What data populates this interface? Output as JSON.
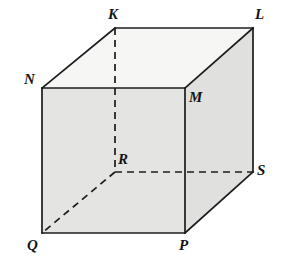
{
  "figure": {
    "name": "cube-diagram",
    "type": "geometric-solid",
    "solid": "cube",
    "canvas": {
      "width": 281,
      "height": 269
    },
    "colors": {
      "background": "#ffffff",
      "edge_stroke": "#1c1c1c",
      "hidden_edge_stroke": "#1c1c1c",
      "top_face_fill": "#f6f6f4",
      "front_face_fill": "#e4e4e2",
      "right_face_fill": "#e0e0de",
      "label_color": "#141414"
    },
    "stroke_widths": {
      "visible_edge": 1.7,
      "hidden_edge": 1.7
    },
    "dash_pattern": "7 5"
  },
  "vertices": [
    {
      "id": "K",
      "label": "K",
      "x": 115,
      "y": 28,
      "hidden": false,
      "label_x": 108,
      "label_y": 7
    },
    {
      "id": "L",
      "label": "L",
      "x": 253,
      "y": 28,
      "hidden": false,
      "label_x": 255,
      "label_y": 7
    },
    {
      "id": "N",
      "label": "N",
      "x": 42,
      "y": 88,
      "hidden": false,
      "label_x": 24,
      "label_y": 72
    },
    {
      "id": "M",
      "label": "M",
      "x": 185,
      "y": 88,
      "hidden": false,
      "label_x": 189,
      "label_y": 90
    },
    {
      "id": "R",
      "label": "R",
      "x": 115,
      "y": 172,
      "hidden": true,
      "label_x": 118,
      "label_y": 152
    },
    {
      "id": "S",
      "label": "S",
      "x": 253,
      "y": 172,
      "hidden": false,
      "label_x": 257,
      "label_y": 163
    },
    {
      "id": "Q",
      "label": "Q",
      "x": 42,
      "y": 233,
      "hidden": false,
      "label_x": 27,
      "label_y": 238
    },
    {
      "id": "P",
      "label": "P",
      "x": 185,
      "y": 233,
      "hidden": false,
      "label_x": 179,
      "label_y": 238
    }
  ],
  "faces": [
    {
      "id": "top",
      "name": "face-K-L-M-N",
      "points": "115,28 253,28 185,88 42,88",
      "fill_key": "top_face_fill"
    },
    {
      "id": "front",
      "name": "face-N-M-P-Q",
      "points": "42,88 185,88 185,233 42,233",
      "fill_key": "front_face_fill"
    },
    {
      "id": "right",
      "name": "face-M-L-S-P",
      "points": "185,88 253,28 253,172 185,233",
      "fill_key": "right_face_fill"
    }
  ],
  "visible_edges": [
    {
      "id": "KL",
      "name": "edge-K-L",
      "from": "K",
      "to": "L",
      "x1": 115,
      "y1": 28,
      "x2": 253,
      "y2": 28
    },
    {
      "id": "KN",
      "name": "edge-K-N",
      "from": "K",
      "to": "N",
      "x1": 115,
      "y1": 28,
      "x2": 42,
      "y2": 88
    },
    {
      "id": "LM",
      "name": "edge-L-M",
      "from": "L",
      "to": "M",
      "x1": 253,
      "y1": 28,
      "x2": 185,
      "y2": 88
    },
    {
      "id": "LS",
      "name": "edge-L-S",
      "from": "L",
      "to": "S",
      "x1": 253,
      "y1": 28,
      "x2": 253,
      "y2": 172
    },
    {
      "id": "NM",
      "name": "edge-N-M",
      "from": "N",
      "to": "M",
      "x1": 42,
      "y1": 88,
      "x2": 185,
      "y2": 88
    },
    {
      "id": "NQ",
      "name": "edge-N-Q",
      "from": "N",
      "to": "Q",
      "x1": 42,
      "y1": 88,
      "x2": 42,
      "y2": 233
    },
    {
      "id": "MP",
      "name": "edge-M-P",
      "from": "M",
      "to": "P",
      "x1": 185,
      "y1": 88,
      "x2": 185,
      "y2": 233
    },
    {
      "id": "QP",
      "name": "edge-Q-P",
      "from": "Q",
      "to": "P",
      "x1": 42,
      "y1": 233,
      "x2": 185,
      "y2": 233
    },
    {
      "id": "PS",
      "name": "edge-P-S",
      "from": "P",
      "to": "S",
      "x1": 185,
      "y1": 233,
      "x2": 253,
      "y2": 172
    }
  ],
  "hidden_edges": [
    {
      "id": "KR",
      "name": "hidden-edge-K-R",
      "from": "K",
      "to": "R",
      "x1": 115,
      "y1": 28,
      "x2": 115,
      "y2": 172
    },
    {
      "id": "RS",
      "name": "hidden-edge-R-S",
      "from": "R",
      "to": "S",
      "x1": 115,
      "y1": 172,
      "x2": 253,
      "y2": 172
    },
    {
      "id": "RQ",
      "name": "hidden-edge-R-Q",
      "from": "R",
      "to": "Q",
      "x1": 115,
      "y1": 172,
      "x2": 42,
      "y2": 233
    }
  ]
}
